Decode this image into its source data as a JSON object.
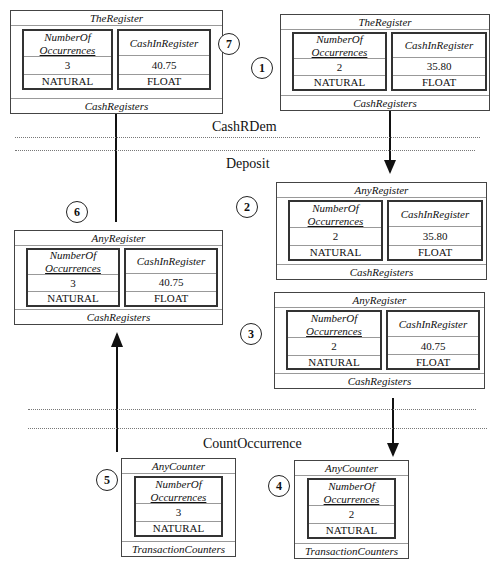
{
  "diagram": {
    "operations": [
      {
        "name": "CashRDem"
      },
      {
        "name": "Deposit"
      },
      {
        "name": "CountOccurrence"
      }
    ],
    "objects": [
      {
        "step": "1",
        "title": "TheRegister",
        "footer": "CashRegisters",
        "fields": [
          {
            "name1": "NumberOf",
            "name2": "Occurrences",
            "value": "2",
            "type": "NATURAL"
          },
          {
            "name1": "CashInRegister",
            "name2": "",
            "value": "35.80",
            "type": "FLOAT"
          }
        ]
      },
      {
        "step": "2",
        "title": "AnyRegister",
        "footer": "CashRegisters",
        "fields": [
          {
            "name1": "NumberOf",
            "name2": "Occurrences",
            "value": "2",
            "type": "NATURAL"
          },
          {
            "name1": "CashInRegister",
            "name2": "",
            "value": "35.80",
            "type": "FLOAT"
          }
        ]
      },
      {
        "step": "3",
        "title": "AnyRegister",
        "footer": "CashRegisters",
        "fields": [
          {
            "name1": "NumberOf",
            "name2": "Occurrences",
            "value": "2",
            "type": "NATURAL"
          },
          {
            "name1": "CashInRegister",
            "name2": "",
            "value": "40.75",
            "type": "FLOAT"
          }
        ]
      },
      {
        "step": "4",
        "title": "AnyCounter",
        "footer": "TransactionCounters",
        "fields": [
          {
            "name1": "NumberOf",
            "name2": "Occurrences",
            "value": "2",
            "type": "NATURAL"
          }
        ]
      },
      {
        "step": "5",
        "title": "AnyCounter",
        "footer": "TransactionCounters",
        "fields": [
          {
            "name1": "NumberOf",
            "name2": "Occurrences",
            "value": "3",
            "type": "NATURAL"
          }
        ]
      },
      {
        "step": "6",
        "title": "AnyRegister",
        "footer": "CashRegisters",
        "fields": [
          {
            "name1": "NumberOf",
            "name2": "Occurrences",
            "value": "3",
            "type": "NATURAL"
          },
          {
            "name1": "CashInRegister",
            "name2": "",
            "value": "40.75",
            "type": "FLOAT"
          }
        ]
      },
      {
        "step": "7",
        "title": "TheRegister",
        "footer": "CashRegisters",
        "fields": [
          {
            "name1": "NumberOf",
            "name2": "Occurrences",
            "value": "3",
            "type": "NATURAL"
          },
          {
            "name1": "CashInRegister",
            "name2": "",
            "value": "40.75",
            "type": "FLOAT"
          }
        ]
      }
    ]
  }
}
